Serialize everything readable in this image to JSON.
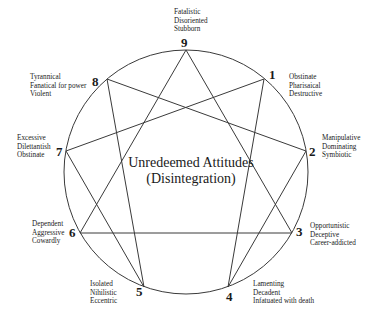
{
  "diagram": {
    "title_line1": "Unredeemed Attitudes",
    "title_line2": "(Disintegration)",
    "circle": {
      "cx": 186,
      "cy": 172,
      "r": 122,
      "stroke": "#3a3a3a"
    },
    "points": [
      {
        "id": "9",
        "number": "9",
        "traits": [
          "Fatalistic",
          "Disoriented",
          "Stubborn"
        ]
      },
      {
        "id": "1",
        "number": "1",
        "traits": [
          "Obstinate",
          "Pharisaical",
          "Destructive"
        ]
      },
      {
        "id": "2",
        "number": "2",
        "traits": [
          "Manipulative",
          "Dominating",
          "Symbiotic"
        ]
      },
      {
        "id": "3",
        "number": "3",
        "traits": [
          "Opportunistic",
          "Deceptive",
          "Career-addicted"
        ]
      },
      {
        "id": "4",
        "number": "4",
        "traits": [
          "Lamenting",
          "Decadent",
          "Infatuated with death"
        ]
      },
      {
        "id": "5",
        "number": "5",
        "traits": [
          "Isolated",
          "Nihilistic",
          "Eccentric"
        ]
      },
      {
        "id": "6",
        "number": "6",
        "traits": [
          "Dependent",
          "Aggressive",
          "Cowardly"
        ]
      },
      {
        "id": "7",
        "number": "7",
        "traits": [
          "Excessive",
          "Dilettantish",
          "Obstinate"
        ]
      },
      {
        "id": "8",
        "number": "8",
        "traits": [
          "Tyrannical",
          "Fanatical for power",
          "Violent"
        ]
      }
    ],
    "triangle": [
      "9",
      "3",
      "6"
    ],
    "hexad": [
      "1",
      "4",
      "2",
      "8",
      "5",
      "7"
    ]
  }
}
